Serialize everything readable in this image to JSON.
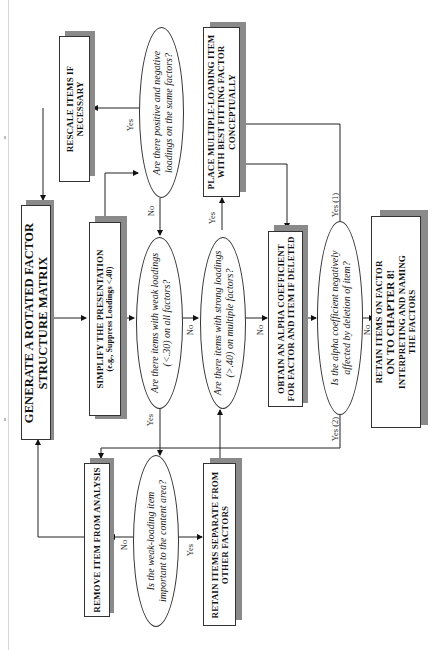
{
  "diagram": {
    "orientation": "rotated-90-ccw",
    "nodes": {
      "generate": {
        "type": "process",
        "lines": [
          "GENERATE A ROTATED FACTOR",
          "STRUCTURE MATRIX"
        ]
      },
      "simplify": {
        "type": "process",
        "lines": [
          "SIMPLIFY THE PRESENTATION",
          "(e.g., Suppress Loadings <.40)"
        ]
      },
      "rescale": {
        "type": "process",
        "lines": [
          "RESCALE ITEMS IF",
          "NECESSARY"
        ]
      },
      "q_posneg": {
        "type": "decision",
        "lines": [
          "Are there positive and negative",
          "loadings on the same factors?"
        ]
      },
      "q_weak": {
        "type": "decision",
        "lines": [
          "Are there items with weak loadings",
          "(<.30) on all factors?"
        ]
      },
      "q_strong": {
        "type": "decision",
        "lines": [
          "Are there items with strong loadings",
          "(>.40) on  multiple factors?"
        ]
      },
      "place_multiple": {
        "type": "process",
        "lines": [
          "PLACE MULTIPLE-LOADING ITEM",
          "WITH BEST FITTING FACTOR",
          "CONCEPTUALLY"
        ]
      },
      "obtain_alpha": {
        "type": "process",
        "lines": [
          "OBTAIN AN ALPHA COEFFICIENT",
          "FOR FACTOR AND ITEM IF DELETED"
        ]
      },
      "q_alpha": {
        "type": "decision",
        "lines": [
          "Is the alpha coefficient negatively",
          "affected by deletion of item?"
        ]
      },
      "retain_on_factor": {
        "type": "process",
        "lines": [
          "RETAIN ITEMS ON FACTOR",
          "ON TO CHAPTER 8!",
          "INTERPRETING AND NAMING",
          "THE FACTORS"
        ]
      },
      "remove_item": {
        "type": "process",
        "lines": [
          "REMOVE ITEM FROM ANALYSIS"
        ]
      },
      "q_important": {
        "type": "decision",
        "lines": [
          "Is the weak-loading item",
          "important to the content area?"
        ]
      },
      "retain_separate": {
        "type": "process",
        "lines": [
          "RETAIN ITEMS SEPARATE FROM",
          "OTHER FACTORS"
        ]
      }
    },
    "edge_labels": {
      "posneg_yes": "Yes",
      "posneg_no": "No",
      "weak_yes": "Yes",
      "weak_no": "No",
      "strong_yes": "Yes",
      "strong_no": "No",
      "alpha_yes1": "Yes (1)",
      "alpha_yes2": "Yes (2)",
      "alpha_no": "No",
      "important_yes": "Yes",
      "important_no": "No"
    }
  }
}
